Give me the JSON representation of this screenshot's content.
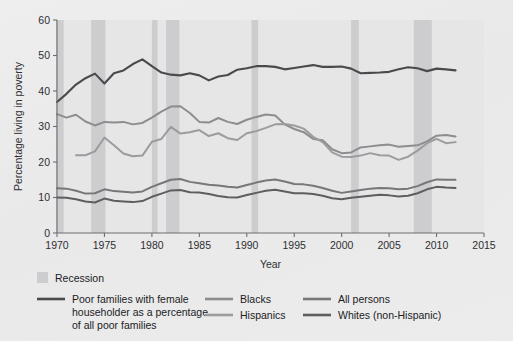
{
  "chart_data": {
    "type": "line",
    "title": "",
    "xlabel": "Year",
    "ylabel": "Percentage living in poverty",
    "xlim": [
      1970,
      2015
    ],
    "ylim": [
      0,
      60
    ],
    "xticks": [
      1970,
      1975,
      1980,
      1985,
      1990,
      1995,
      2000,
      2005,
      2010,
      2015
    ],
    "yticks": [
      0,
      10,
      20,
      30,
      40,
      50,
      60
    ],
    "grid": false,
    "legend_position": "below",
    "x": [
      1970,
      1971,
      1972,
      1973,
      1974,
      1975,
      1976,
      1977,
      1978,
      1979,
      1980,
      1981,
      1982,
      1983,
      1984,
      1985,
      1986,
      1987,
      1988,
      1989,
      1990,
      1991,
      1992,
      1993,
      1994,
      1995,
      1996,
      1997,
      1998,
      1999,
      2000,
      2001,
      2002,
      2003,
      2004,
      2005,
      2006,
      2007,
      2008,
      2009,
      2010,
      2011,
      2012
    ],
    "series": [
      {
        "name": "Poor families with female householder as a percentage of all poor families",
        "color": "#4a4a4c",
        "width": 2.1,
        "values": [
          36.9,
          39.2,
          41.8,
          43.6,
          44.9,
          42.1,
          45.0,
          45.8,
          47.6,
          48.9,
          47.0,
          45.2,
          44.6,
          44.4,
          45.0,
          44.4,
          43.0,
          44.1,
          44.5,
          46.0,
          46.4,
          47.0,
          47.0,
          46.8,
          46.1,
          46.5,
          46.9,
          47.3,
          46.8,
          46.8,
          46.9,
          46.3,
          45.0,
          45.1,
          45.2,
          45.4,
          46.1,
          46.7,
          46.4,
          45.6,
          46.3,
          46.1,
          45.8
        ]
      },
      {
        "name": "Blacks",
        "color": "#8d8d90",
        "width": 2.0,
        "values": [
          33.5,
          32.5,
          33.3,
          31.4,
          30.3,
          31.3,
          31.1,
          31.3,
          30.6,
          31.0,
          32.5,
          34.2,
          35.6,
          35.7,
          33.8,
          31.3,
          31.1,
          32.4,
          31.3,
          30.7,
          31.9,
          32.7,
          33.4,
          33.1,
          30.6,
          29.3,
          28.4,
          26.5,
          26.1,
          23.6,
          22.5,
          22.7,
          24.1,
          24.4,
          24.7,
          24.9,
          24.3,
          24.5,
          24.7,
          25.8,
          27.4,
          27.6,
          27.2
        ]
      },
      {
        "name": "Hispanics",
        "color": "#9c9c9f",
        "width": 2.0,
        "values": [
          null,
          null,
          21.9,
          21.9,
          23.0,
          26.9,
          24.7,
          22.4,
          21.6,
          21.8,
          25.7,
          26.5,
          29.9,
          28.0,
          28.4,
          29.0,
          27.3,
          28.1,
          26.7,
          26.2,
          28.1,
          28.7,
          29.6,
          30.6,
          30.7,
          30.3,
          29.4,
          27.1,
          25.6,
          22.7,
          21.5,
          21.4,
          21.8,
          22.5,
          21.9,
          21.8,
          20.6,
          21.5,
          23.2,
          25.3,
          26.5,
          25.3,
          25.6
        ]
      },
      {
        "name": "All persons",
        "color": "#777779",
        "width": 2.0,
        "values": [
          12.6,
          12.5,
          11.9,
          11.1,
          11.2,
          12.3,
          11.8,
          11.6,
          11.4,
          11.7,
          13.0,
          14.0,
          15.0,
          15.2,
          14.4,
          14.0,
          13.6,
          13.4,
          13.0,
          12.8,
          13.5,
          14.2,
          14.8,
          15.1,
          14.5,
          13.8,
          13.7,
          13.3,
          12.7,
          11.9,
          11.3,
          11.7,
          12.1,
          12.5,
          12.7,
          12.6,
          12.3,
          12.5,
          13.2,
          14.3,
          15.1,
          15.0,
          15.0
        ]
      },
      {
        "name": "Whites (non-Hispanic)",
        "color": "#5e5e60",
        "width": 2.0,
        "values": [
          10.0,
          9.9,
          9.5,
          8.9,
          8.6,
          9.7,
          9.1,
          8.9,
          8.7,
          9.0,
          10.2,
          11.1,
          12.0,
          12.1,
          11.5,
          11.4,
          11.0,
          10.4,
          10.1,
          10.0,
          10.7,
          11.3,
          11.9,
          12.2,
          11.7,
          11.2,
          11.2,
          11.0,
          10.5,
          9.8,
          9.5,
          9.9,
          10.2,
          10.5,
          10.8,
          10.6,
          10.3,
          10.5,
          11.2,
          12.3,
          13.0,
          12.8,
          12.7
        ]
      }
    ],
    "recessions": [
      {
        "start": 1969.9,
        "end": 1970.7
      },
      {
        "start": 1973.6,
        "end": 1975.1
      },
      {
        "start": 1980.0,
        "end": 1980.6
      },
      {
        "start": 1981.5,
        "end": 1982.9
      },
      {
        "start": 1990.5,
        "end": 1991.2
      },
      {
        "start": 2001.0,
        "end": 2001.8
      },
      {
        "start": 2007.6,
        "end": 2009.5
      }
    ],
    "annotations": []
  },
  "legend": {
    "recession_label": "Recession",
    "entries": [
      {
        "label": "Poor families with female householder as a percentage of all poor families",
        "color": "#4a4a4c"
      },
      {
        "label": "Blacks",
        "color": "#8d8d90"
      },
      {
        "label": "Hispanics",
        "color": "#9c9c9f"
      },
      {
        "label": "All persons",
        "color": "#777779"
      },
      {
        "label": "Whites (non-Hispanic)",
        "color": "#5e5e60"
      }
    ],
    "entry_lines": {
      "main_line_1": "Poor families with female",
      "main_line_2": "householder as a percentage",
      "main_line_3": "of all poor families",
      "blacks": "Blacks",
      "hispanics": "Hispanics",
      "all_persons": "All persons",
      "whites": "Whites (non-Hispanic)"
    }
  },
  "axes": {
    "x_title": "Year",
    "y_title": "Percentage living in poverty",
    "x_tick_labels": [
      "1970",
      "1975",
      "1980",
      "1985",
      "1990",
      "1995",
      "2000",
      "2005",
      "2010",
      "2015"
    ],
    "y_tick_labels": [
      "0",
      "10",
      "20",
      "30",
      "40",
      "50",
      "60"
    ]
  },
  "colors": {
    "background": "#ececed",
    "plot_background": "#e6e6e7",
    "recession_band": "#cdcdcf",
    "axis": "#6e6e70",
    "text": "#212123"
  }
}
